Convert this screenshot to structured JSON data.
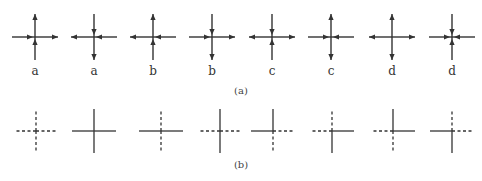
{
  "figure": {
    "stroke_color": "#333333",
    "row_a": {
      "caption": "(a)",
      "center_y": 37,
      "arm_length": 23,
      "crosses": [
        {
          "x": 35,
          "label": "a",
          "top": "out",
          "right": "out",
          "bottom": "in",
          "left": "in"
        },
        {
          "x": 94,
          "label": "a",
          "top": "in",
          "right": "in",
          "bottom": "out",
          "left": "out"
        },
        {
          "x": 153,
          "label": "b",
          "top": "out",
          "right": "in",
          "bottom": "in",
          "left": "out"
        },
        {
          "x": 212,
          "label": "b",
          "top": "in",
          "right": "out",
          "bottom": "out",
          "left": "in"
        },
        {
          "x": 272,
          "label": "c",
          "top": "in",
          "right": "out",
          "bottom": "in",
          "left": "out"
        },
        {
          "x": 331,
          "label": "c",
          "top": "out",
          "right": "in",
          "bottom": "out",
          "left": "in"
        },
        {
          "x": 392,
          "label": "d",
          "top": "out",
          "right": "out",
          "bottom": "out",
          "left": "out"
        },
        {
          "x": 452,
          "label": "d",
          "top": "in",
          "right": "in",
          "bottom": "in",
          "left": "in"
        }
      ]
    },
    "row_b": {
      "caption": "(b)",
      "center_y": 131,
      "arm_length": 22,
      "crosses": [
        {
          "x": 36,
          "top": "dashed",
          "right": "dashed",
          "bottom": "dashed",
          "left": "dashed"
        },
        {
          "x": 94,
          "top": "solid",
          "right": "solid",
          "bottom": "solid",
          "left": "solid"
        },
        {
          "x": 161,
          "top": "dashed",
          "right": "solid",
          "bottom": "dashed",
          "left": "solid"
        },
        {
          "x": 220,
          "top": "solid",
          "right": "dashed",
          "bottom": "solid",
          "left": "dashed"
        },
        {
          "x": 273,
          "top": "solid",
          "right": "dashed",
          "bottom": "dashed",
          "left": "solid"
        },
        {
          "x": 332,
          "top": "dashed",
          "right": "solid",
          "bottom": "solid",
          "left": "dashed"
        },
        {
          "x": 393,
          "top": "solid",
          "right": "solid",
          "bottom": "dashed",
          "left": "dashed"
        },
        {
          "x": 452,
          "top": "dashed",
          "right": "dashed",
          "bottom": "solid",
          "left": "solid"
        }
      ]
    }
  }
}
